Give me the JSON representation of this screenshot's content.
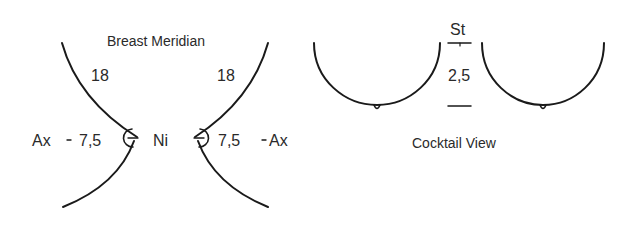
{
  "breast_meridian": {
    "title": "Breast Meridian",
    "left": {
      "upper_measure": "18",
      "axilla_label": "Ax",
      "dash": "-",
      "lateral_measure": "7,5"
    },
    "right": {
      "upper_measure": "18",
      "axilla_label": "Ax",
      "dash": "-",
      "lateral_measure": "7,5"
    },
    "center_label": "Ni"
  },
  "cocktail_view": {
    "title": "Cocktail View",
    "sternum_label": "St",
    "intermammary_measure": "2,5"
  }
}
